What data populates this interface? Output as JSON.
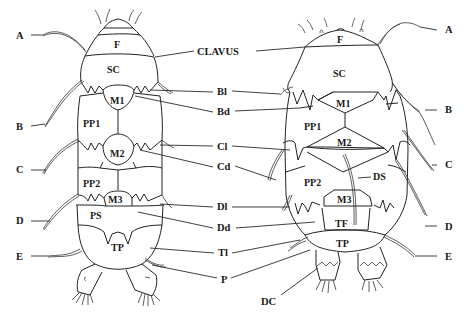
{
  "figure": {
    "background": "#ffffff",
    "ink_color": "#1a1a1a",
    "specimens": [
      {
        "name": "left-specimen",
        "plates": {
          "F": "F",
          "SC": "SC",
          "M1": "M1",
          "PP1": "PP1",
          "M2": "M2",
          "PP2": "PP2",
          "M3": "M3",
          "PS": "PS",
          "TP": "TP"
        }
      },
      {
        "name": "right-specimen",
        "plates": {
          "F": "F",
          "SC": "SC",
          "M1": "M1",
          "PP1": "PP1",
          "M2": "M2",
          "PP2": "PP2",
          "DS": "DS",
          "M3": "M3",
          "TF": "TF",
          "TP": "TP"
        }
      }
    ],
    "left_labels": [
      "A",
      "B",
      "C",
      "D",
      "E"
    ],
    "right_labels": [
      "A",
      "B",
      "C",
      "D",
      "E"
    ],
    "center_labels": [
      "CLAVUS",
      "Bl",
      "Bd",
      "Cl",
      "Cd",
      "Dl",
      "Dd",
      "Tl",
      "P",
      "DC"
    ]
  }
}
